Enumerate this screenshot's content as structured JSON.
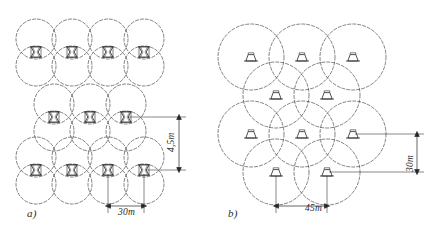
{
  "figure": {
    "background_color": "#ffffff",
    "line_color": "#3a3a3a",
    "panels": [
      {
        "id": "a",
        "caption": "a)",
        "contour_shape": "figure-eight",
        "symbol": "bowtie-luminaire-icon",
        "rows": [
          {
            "count": 4,
            "offset": "aligned"
          },
          {
            "count": 3,
            "offset": "staggered"
          },
          {
            "count": 4,
            "offset": "aligned"
          }
        ],
        "dimensions": [
          {
            "name": "spacing-horizontal",
            "label": "30m",
            "value": 30,
            "unit": "m",
            "orientation": "horizontal"
          },
          {
            "name": "spacing-vertical",
            "label": "4,5m",
            "value": 4.5,
            "unit": "m",
            "orientation": "vertical"
          }
        ]
      },
      {
        "id": "b",
        "caption": "b)",
        "contour_shape": "circle",
        "symbol": "trapezoid-luminaire-icon",
        "rows": [
          {
            "count": 3,
            "offset": "aligned"
          },
          {
            "count": 2,
            "offset": "staggered"
          },
          {
            "count": 3,
            "offset": "aligned"
          },
          {
            "count": 2,
            "offset": "staggered"
          }
        ],
        "dimensions": [
          {
            "name": "spacing-horizontal",
            "label": "45m",
            "value": 45,
            "unit": "m",
            "orientation": "horizontal"
          },
          {
            "name": "spacing-vertical",
            "label": "30m",
            "value": 30,
            "unit": "m",
            "orientation": "vertical"
          }
        ]
      }
    ]
  }
}
